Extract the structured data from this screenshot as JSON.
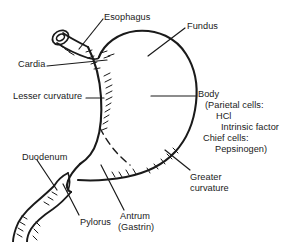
{
  "figure": {
    "background_color": "#ffffff",
    "ink_color": "#1a1a1a"
  },
  "labels": {
    "esophagus": "Esophagus",
    "fundus": "Fundus",
    "cardia": "Cardia",
    "lesser_curvature": "Lesser curvature",
    "body": "Body",
    "body_detail_1": "(Parietal cells:",
    "body_detail_2": "HCl",
    "body_detail_3": "Intrinsic factor",
    "body_detail_4": "Chief cells:",
    "body_detail_5": "Pepsinogen)",
    "duodenum": "Duodenum",
    "greater_curvature_1": "Greater",
    "greater_curvature_2": "curvature",
    "pylorus": "Pylorus",
    "antrum_1": "Antrum",
    "antrum_2": "(Gastrin)"
  }
}
